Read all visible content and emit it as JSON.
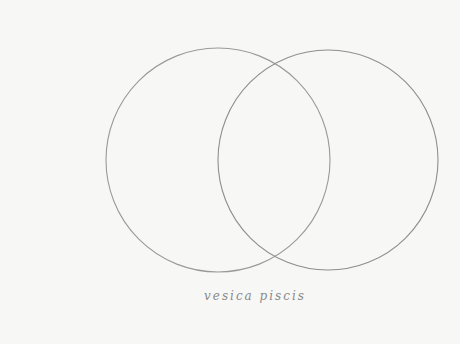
{
  "title": "vesica piscis",
  "caption": "vesica piscis",
  "colors": {
    "paper": "#f7f7f6",
    "pencil": "#9a9a9a"
  },
  "figures": [
    {
      "name": "left-circle",
      "shape": "circle"
    },
    {
      "name": "right-circle",
      "shape": "circle"
    }
  ]
}
